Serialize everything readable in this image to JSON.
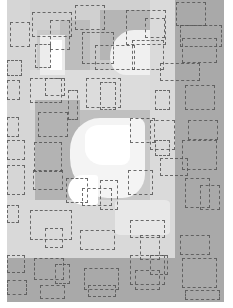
{
  "artwork": {
    "width": 233,
    "height": 308,
    "background": "#ffffff",
    "fills": [
      {
        "x": 7,
        "y": 0,
        "w": 217,
        "h": 302,
        "color": "#c9c9c9"
      },
      {
        "x": 7,
        "y": 0,
        "w": 30,
        "h": 258,
        "color": "#d6d6d6"
      },
      {
        "x": 30,
        "y": 0,
        "w": 120,
        "h": 30,
        "color": "#d0d0d0"
      },
      {
        "x": 60,
        "y": 20,
        "w": 30,
        "h": 60,
        "color": "#bdbdbd"
      },
      {
        "x": 100,
        "y": 10,
        "w": 50,
        "h": 50,
        "color": "#b5b5b5"
      },
      {
        "x": 150,
        "y": 0,
        "w": 25,
        "h": 302,
        "color": "#dadada"
      },
      {
        "x": 175,
        "y": 0,
        "w": 49,
        "h": 302,
        "color": "#a9a9a9"
      },
      {
        "x": 30,
        "y": 70,
        "w": 120,
        "h": 40,
        "color": "#dcdcdc"
      },
      {
        "x": 35,
        "y": 100,
        "w": 45,
        "h": 150,
        "color": "#b3b3b3"
      },
      {
        "x": 80,
        "y": 110,
        "w": 70,
        "h": 30,
        "color": "#bfbfbf"
      },
      {
        "x": 7,
        "y": 200,
        "w": 168,
        "h": 58,
        "color": "#d9d9d9"
      },
      {
        "x": 7,
        "y": 258,
        "w": 217,
        "h": 44,
        "color": "#a9a9a9"
      },
      {
        "x": 40,
        "y": 35,
        "w": 25,
        "h": 40,
        "color": "#ececec"
      },
      {
        "x": 50,
        "y": 40,
        "w": 12,
        "h": 30,
        "color": "#ffffff"
      }
    ],
    "blobs": [
      {
        "x": 70,
        "y": 118,
        "w": 75,
        "h": 80,
        "color": "#f4f4f4",
        "radius": "40% 10% 30% 50%"
      },
      {
        "x": 85,
        "y": 125,
        "w": 45,
        "h": 40,
        "color": "#ffffff",
        "radius": "30% 5% 20% 40%"
      },
      {
        "x": 68,
        "y": 175,
        "w": 30,
        "h": 30,
        "color": "#ffffff",
        "radius": "50% 10% 10% 50%"
      },
      {
        "x": 110,
        "y": 30,
        "w": 40,
        "h": 45,
        "color": "#f0f0f0",
        "radius": "60% 0 0 40%"
      },
      {
        "x": 115,
        "y": 200,
        "w": 55,
        "h": 35,
        "color": "#e8e8e8",
        "radius": "10%"
      }
    ],
    "dashed_rects": [
      {
        "x": 32,
        "y": 12,
        "w": 40,
        "h": 25
      },
      {
        "x": 50,
        "y": 20,
        "w": 20,
        "h": 30
      },
      {
        "x": 75,
        "y": 5,
        "w": 30,
        "h": 25
      },
      {
        "x": 126,
        "y": 10,
        "w": 40,
        "h": 35
      },
      {
        "x": 145,
        "y": 18,
        "w": 20,
        "h": 20
      },
      {
        "x": 176,
        "y": 2,
        "w": 30,
        "h": 24
      },
      {
        "x": 180,
        "y": 25,
        "w": 42,
        "h": 22
      },
      {
        "x": 10,
        "y": 22,
        "w": 20,
        "h": 25
      },
      {
        "x": 7,
        "y": 60,
        "w": 15,
        "h": 16
      },
      {
        "x": 82,
        "y": 32,
        "w": 32,
        "h": 32
      },
      {
        "x": 95,
        "y": 45,
        "w": 40,
        "h": 25
      },
      {
        "x": 132,
        "y": 40,
        "w": 32,
        "h": 30
      },
      {
        "x": 182,
        "y": 38,
        "w": 35,
        "h": 25
      },
      {
        "x": 35,
        "y": 44,
        "w": 16,
        "h": 24
      },
      {
        "x": 7,
        "y": 80,
        "w": 13,
        "h": 20
      },
      {
        "x": 30,
        "y": 78,
        "w": 32,
        "h": 25
      },
      {
        "x": 45,
        "y": 78,
        "w": 20,
        "h": 18
      },
      {
        "x": 68,
        "y": 90,
        "w": 10,
        "h": 30
      },
      {
        "x": 86,
        "y": 78,
        "w": 35,
        "h": 30
      },
      {
        "x": 100,
        "y": 82,
        "w": 16,
        "h": 28
      },
      {
        "x": 160,
        "y": 63,
        "w": 40,
        "h": 18
      },
      {
        "x": 185,
        "y": 85,
        "w": 30,
        "h": 25
      },
      {
        "x": 155,
        "y": 90,
        "w": 15,
        "h": 20
      },
      {
        "x": 38,
        "y": 112,
        "w": 30,
        "h": 25
      },
      {
        "x": 7,
        "y": 117,
        "w": 12,
        "h": 20
      },
      {
        "x": 7,
        "y": 140,
        "w": 18,
        "h": 20
      },
      {
        "x": 34,
        "y": 142,
        "w": 28,
        "h": 30
      },
      {
        "x": 130,
        "y": 118,
        "w": 25,
        "h": 25
      },
      {
        "x": 150,
        "y": 120,
        "w": 25,
        "h": 30
      },
      {
        "x": 188,
        "y": 120,
        "w": 30,
        "h": 20
      },
      {
        "x": 182,
        "y": 140,
        "w": 35,
        "h": 30
      },
      {
        "x": 155,
        "y": 140,
        "w": 15,
        "h": 16
      },
      {
        "x": 7,
        "y": 165,
        "w": 18,
        "h": 30
      },
      {
        "x": 33,
        "y": 170,
        "w": 30,
        "h": 20
      },
      {
        "x": 66,
        "y": 178,
        "w": 22,
        "h": 25
      },
      {
        "x": 82,
        "y": 188,
        "w": 30,
        "h": 18
      },
      {
        "x": 100,
        "y": 180,
        "w": 18,
        "h": 30
      },
      {
        "x": 128,
        "y": 170,
        "w": 25,
        "h": 25
      },
      {
        "x": 160,
        "y": 158,
        "w": 28,
        "h": 18
      },
      {
        "x": 185,
        "y": 178,
        "w": 25,
        "h": 30
      },
      {
        "x": 200,
        "y": 185,
        "w": 20,
        "h": 25
      },
      {
        "x": 7,
        "y": 205,
        "w": 12,
        "h": 18
      },
      {
        "x": 30,
        "y": 210,
        "w": 42,
        "h": 30
      },
      {
        "x": 45,
        "y": 228,
        "w": 18,
        "h": 20
      },
      {
        "x": 80,
        "y": 230,
        "w": 35,
        "h": 20
      },
      {
        "x": 130,
        "y": 220,
        "w": 35,
        "h": 18
      },
      {
        "x": 140,
        "y": 235,
        "w": 20,
        "h": 25
      },
      {
        "x": 180,
        "y": 235,
        "w": 30,
        "h": 20
      },
      {
        "x": 7,
        "y": 255,
        "w": 18,
        "h": 18
      },
      {
        "x": 34,
        "y": 258,
        "w": 30,
        "h": 22
      },
      {
        "x": 55,
        "y": 264,
        "w": 15,
        "h": 20
      },
      {
        "x": 84,
        "y": 268,
        "w": 35,
        "h": 22
      },
      {
        "x": 88,
        "y": 285,
        "w": 28,
        "h": 12
      },
      {
        "x": 130,
        "y": 255,
        "w": 35,
        "h": 30
      },
      {
        "x": 150,
        "y": 255,
        "w": 18,
        "h": 20
      },
      {
        "x": 135,
        "y": 270,
        "w": 25,
        "h": 20
      },
      {
        "x": 182,
        "y": 258,
        "w": 35,
        "h": 30
      },
      {
        "x": 185,
        "y": 290,
        "w": 35,
        "h": 10
      },
      {
        "x": 7,
        "y": 280,
        "w": 20,
        "h": 15
      },
      {
        "x": 40,
        "y": 285,
        "w": 25,
        "h": 14
      }
    ]
  }
}
